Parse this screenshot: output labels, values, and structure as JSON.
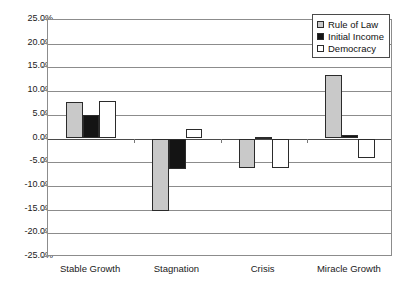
{
  "chart_data": {
    "type": "bar",
    "title": "",
    "subtitle": "",
    "xlabel": "",
    "ylabel": "",
    "categories": [
      "Stable Growth",
      "Stagnation",
      "Crisis",
      "Miracle Growth"
    ],
    "series": [
      {
        "name": "Rule of Law",
        "color": "#c9c9c9",
        "values": [
          7.7,
          -15.2,
          -6.3,
          13.5
        ]
      },
      {
        "name": "Initial Income",
        "color": "#141414",
        "values": [
          5.0,
          -6.4,
          0.4,
          0.7
        ]
      },
      {
        "name": "Democracy",
        "color": "#ffffff",
        "values": [
          8.0,
          2.1,
          -6.3,
          -4.2
        ]
      }
    ],
    "ylim": [
      -25,
      25
    ],
    "ytick_step": 5,
    "ytick_labels": [
      "25.0%",
      "20.0%",
      "15.0%",
      "10.0%",
      "5.0%",
      "0.0%",
      "-5.0%",
      "-10.0%",
      "-15.0%",
      "-20.0%",
      "-25.0%"
    ],
    "ytick_values": [
      25,
      20,
      15,
      10,
      5,
      0,
      -5,
      -10,
      -15,
      -20,
      -25
    ],
    "grid": true,
    "grid_axis": "y",
    "legend_position": "top-right",
    "legend_entries": [
      "Rule of Law",
      "Initial Income",
      "Democracy"
    ],
    "value_format": "percent"
  }
}
